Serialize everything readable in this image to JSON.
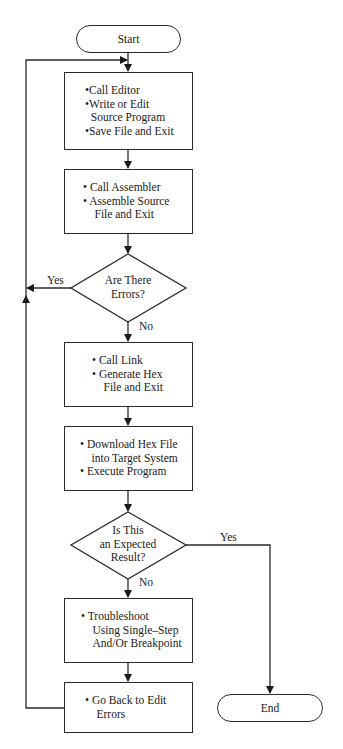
{
  "nodes": {
    "start": {
      "label": "Start"
    },
    "edit": {
      "lines": [
        "•Call Editor",
        "•Write or Edit",
        " Source Program",
        "•Save File and Exit"
      ]
    },
    "assemble": {
      "lines": [
        "• Call Assembler",
        "• Assemble Source",
        " File and Exit"
      ]
    },
    "errors_decision": {
      "lines": [
        "Are There",
        "Errors?"
      ]
    },
    "link": {
      "lines": [
        "• Call Link",
        "• Generate Hex",
        " File and Exit"
      ]
    },
    "download": {
      "lines": [
        "• Download Hex File",
        " into Target System",
        "• Execute Program"
      ]
    },
    "expected_decision": {
      "lines": [
        "Is This",
        "an Expected",
        "Result?"
      ]
    },
    "troubleshoot": {
      "lines": [
        "• Troubleshoot",
        " Using Single–Step",
        " And/Or Breakpoint"
      ]
    },
    "goback": {
      "lines": [
        "• Go Back to Edit",
        " Errors"
      ]
    },
    "end": {
      "label": "End"
    }
  },
  "edge_labels": {
    "errors_yes": "Yes",
    "errors_no": "No",
    "expected_yes": "Yes",
    "expected_no": "No"
  }
}
